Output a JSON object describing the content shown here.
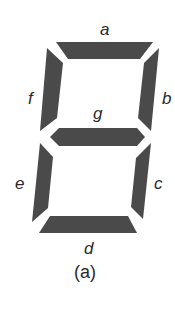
{
  "diagram": {
    "type": "seven-segment-display",
    "segment_color": "#4a4a4a",
    "segments": [
      {
        "id": "a",
        "label": "a"
      },
      {
        "id": "b",
        "label": "b"
      },
      {
        "id": "c",
        "label": "c"
      },
      {
        "id": "d",
        "label": "d"
      },
      {
        "id": "e",
        "label": "e"
      },
      {
        "id": "f",
        "label": "f"
      },
      {
        "id": "g",
        "label": "g"
      }
    ],
    "caption": "(a)"
  }
}
